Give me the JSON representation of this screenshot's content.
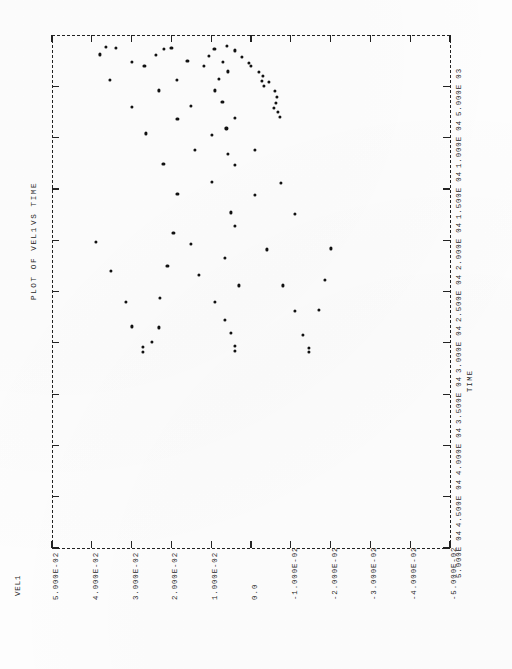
{
  "document": {
    "kind": "line-printer-plot",
    "orientation": "landscape-rotated-90",
    "background_color": "#fefefe",
    "ink_color": "#1a1a1a"
  },
  "title": {
    "main": "PLOT OF VEL1",
    "sub": "VS TIME",
    "full": "PLOT OF VEL1  VS TIME"
  },
  "axes": {
    "vertical_axis_label": "VEL1",
    "horizontal_axis_label": "TIME"
  },
  "chart_data": {
    "type": "scatter",
    "title": "PLOT OF VEL1  VS TIME",
    "xlabel": "TIME",
    "ylabel": "VEL1",
    "grid": false,
    "legend": null,
    "frame_style": "dashed",
    "marker": "dot",
    "xlim": [
      0,
      50000
    ],
    "ylim": [
      -0.05,
      0.05
    ],
    "xticks": [
      5000,
      10000,
      15000,
      20000,
      25000,
      30000,
      35000,
      40000,
      45000,
      50000
    ],
    "xticklabels": [
      "5.000E 03",
      "1.000E 04",
      "1.500E 04",
      "2.000E 04",
      "2.500E 04",
      "3.000E 04",
      "3.500E 04",
      "4.000E 04",
      "4.500E 04",
      "5.000E 04"
    ],
    "yticks": [
      0.05,
      0.04,
      0.03,
      0.02,
      0.01,
      0.0,
      -0.01,
      -0.02,
      -0.03,
      -0.04,
      -0.05
    ],
    "yticklabels": [
      "5.000E-02",
      "4.000E-02",
      "3.000E-02",
      "2.000E-02",
      "1.000E-02",
      "0.0",
      "-1.000E-02",
      "-2.000E-02",
      "-3.000E-02",
      "-4.000E-02",
      "-5.000E-02"
    ],
    "points": [
      {
        "x": 1200,
        "y": 0.0365
      },
      {
        "x": 1250,
        "y": 0.034
      },
      {
        "x": 1900,
        "y": 0.038
      },
      {
        "x": 2600,
        "y": 0.03
      },
      {
        "x": 3050,
        "y": 0.0268
      },
      {
        "x": 4400,
        "y": 0.0355
      },
      {
        "x": 5400,
        "y": 0.0232
      },
      {
        "x": 7000,
        "y": 0.03
      },
      {
        "x": 8200,
        "y": 0.0185
      },
      {
        "x": 9600,
        "y": 0.0265
      },
      {
        "x": 11200,
        "y": 0.014
      },
      {
        "x": 12600,
        "y": 0.022
      },
      {
        "x": 14300,
        "y": 0.0098
      },
      {
        "x": 15500,
        "y": 0.0185
      },
      {
        "x": 17300,
        "y": 0.005
      },
      {
        "x": 1250,
        "y": 0.02
      },
      {
        "x": 1350,
        "y": 0.0218
      },
      {
        "x": 1950,
        "y": 0.0238
      },
      {
        "x": 2550,
        "y": 0.016
      },
      {
        "x": 3050,
        "y": 0.0118
      },
      {
        "x": 4350,
        "y": 0.0186
      },
      {
        "x": 5400,
        "y": 0.009
      },
      {
        "x": 6900,
        "y": 0.015
      },
      {
        "x": 8100,
        "y": 0.004
      },
      {
        "x": 9700,
        "y": 0.0098
      },
      {
        "x": 11200,
        "y": -0.001
      },
      {
        "x": 12700,
        "y": 0.004
      },
      {
        "x": 14400,
        "y": -0.0075
      },
      {
        "x": 15600,
        "y": -0.001
      },
      {
        "x": 17400,
        "y": -0.011
      },
      {
        "x": 1100,
        "y": 0.006
      },
      {
        "x": 1350,
        "y": 0.0092
      },
      {
        "x": 1500,
        "y": 0.004
      },
      {
        "x": 2000,
        "y": 0.0105
      },
      {
        "x": 2100,
        "y": 0.0022
      },
      {
        "x": 2700,
        "y": 0.0005
      },
      {
        "x": 3050,
        "y": 0.0
      },
      {
        "x": 3550,
        "y": 0.0058
      },
      {
        "x": 3600,
        "y": -0.002
      },
      {
        "x": 4000,
        "y": -0.003
      },
      {
        "x": 4450,
        "y": -0.0028
      },
      {
        "x": 4600,
        "y": -0.0045
      },
      {
        "x": 5000,
        "y": -0.0032
      },
      {
        "x": 5450,
        "y": -0.006
      },
      {
        "x": 6050,
        "y": -0.0065
      },
      {
        "x": 6600,
        "y": -0.0062
      },
      {
        "x": 7100,
        "y": -0.0058
      },
      {
        "x": 7500,
        "y": -0.0068
      },
      {
        "x": 8000,
        "y": -0.0072
      },
      {
        "x": 2600,
        "y": 0.007
      },
      {
        "x": 4300,
        "y": 0.008
      },
      {
        "x": 6500,
        "y": 0.0072
      },
      {
        "x": 9100,
        "y": 0.0062
      },
      {
        "x": 11600,
        "y": 0.0058
      },
      {
        "x": 20200,
        "y": 0.039
      },
      {
        "x": 23000,
        "y": 0.0352
      },
      {
        "x": 26000,
        "y": 0.0315
      },
      {
        "x": 28400,
        "y": 0.03
      },
      {
        "x": 30400,
        "y": 0.0272
      },
      {
        "x": 30900,
        "y": 0.0272
      },
      {
        "x": 28500,
        "y": 0.0232
      },
      {
        "x": 29900,
        "y": 0.025
      },
      {
        "x": 25600,
        "y": 0.0228
      },
      {
        "x": 22500,
        "y": 0.021
      },
      {
        "x": 19300,
        "y": 0.0195
      },
      {
        "x": 20400,
        "y": 0.015
      },
      {
        "x": 23400,
        "y": 0.013
      },
      {
        "x": 26000,
        "y": 0.009
      },
      {
        "x": 27800,
        "y": 0.0065
      },
      {
        "x": 29000,
        "y": 0.005
      },
      {
        "x": 30300,
        "y": 0.004
      },
      {
        "x": 30800,
        "y": 0.004
      },
      {
        "x": 21700,
        "y": 0.0065
      },
      {
        "x": 24400,
        "y": 0.003
      },
      {
        "x": 18600,
        "y": 0.004
      },
      {
        "x": 20900,
        "y": -0.004
      },
      {
        "x": 24400,
        "y": -0.008
      },
      {
        "x": 26900,
        "y": -0.011
      },
      {
        "x": 29200,
        "y": -0.013
      },
      {
        "x": 30500,
        "y": -0.0145
      },
      {
        "x": 30900,
        "y": -0.0145
      },
      {
        "x": 26800,
        "y": -0.017
      },
      {
        "x": 23900,
        "y": -0.0185
      },
      {
        "x": 20800,
        "y": -0.02
      }
    ]
  }
}
